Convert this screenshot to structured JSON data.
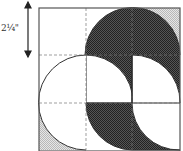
{
  "diagram": {
    "dimension_label": "2¼\"",
    "grid": {
      "rows": 3,
      "cols": 3,
      "cell_size": "2¼\""
    },
    "colors": {
      "dark_fill": "#3d3d3d",
      "light_fill": "#d6d6d6",
      "outline": "#333333",
      "dashed_line": "#777777",
      "background": "#ffffff"
    }
  }
}
